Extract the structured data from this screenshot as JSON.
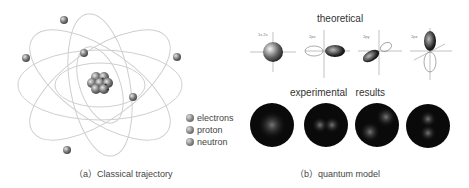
{
  "panel_a": {
    "caption": "（a）Classical trajectory",
    "legend": [
      {
        "icon": "electron-icon",
        "label": "electrons",
        "symbol": "−"
      },
      {
        "icon": "proton-icon",
        "label": "proton",
        "symbol": "+"
      },
      {
        "icon": "neutron-icon",
        "label": "neutron",
        "symbol": ""
      }
    ]
  },
  "panel_b": {
    "caption": "（b）quantum model",
    "theoretical_title": "theoretical",
    "experimental_title": "experimental   results",
    "orbitals": [
      {
        "name": "1s 2s",
        "shape": "sphere"
      },
      {
        "name": "2px",
        "shape": "p-x"
      },
      {
        "name": "2py",
        "shape": "p-y"
      },
      {
        "name": "2pz",
        "shape": "p-z"
      }
    ],
    "experimental_images": [
      "s-density",
      "px-density",
      "py-density",
      "pz-density"
    ]
  }
}
